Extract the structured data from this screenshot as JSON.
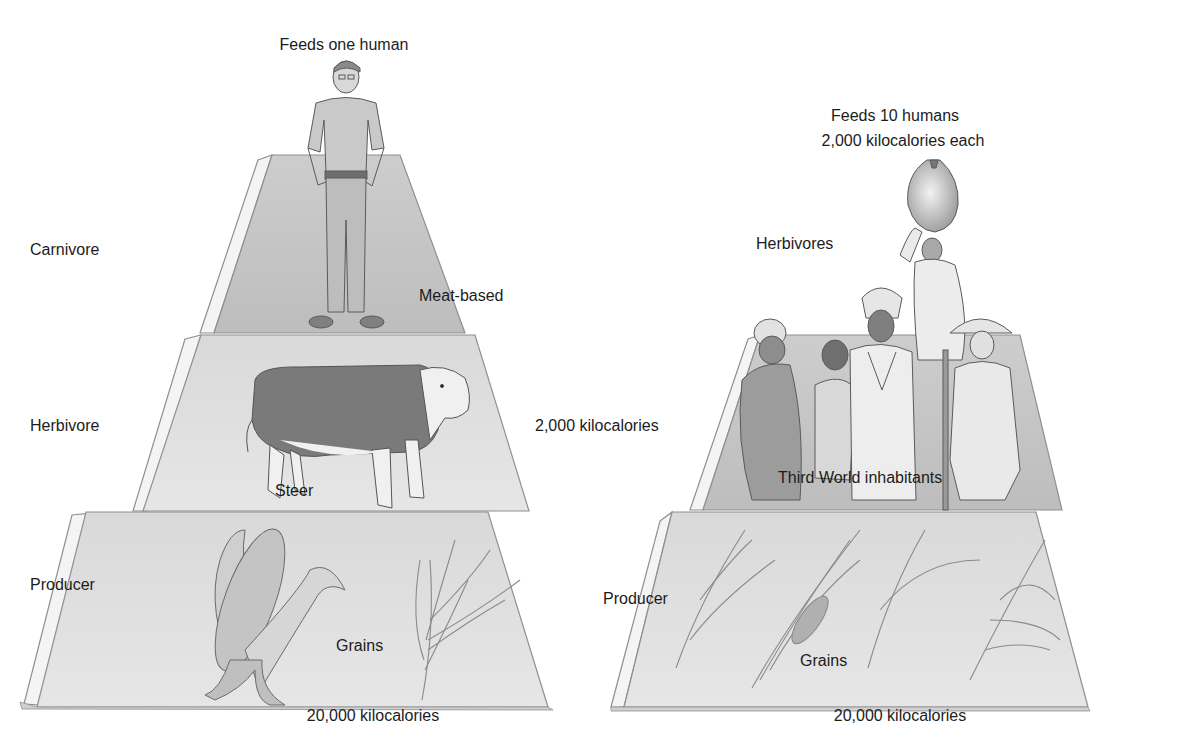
{
  "figure": {
    "colors": {
      "background": "#ffffff",
      "tier_face": "#e3e3e3",
      "tier_face_dark": "#cfcfcf",
      "tier_side": "#f4f4f4",
      "tier_edge": "#8f8f8f",
      "text": "#1c1c1c"
    }
  },
  "left_pyramid": {
    "top_label": "Feeds one human",
    "tier_labels": {
      "carnivore": "Carnivore",
      "herbivore": "Herbivore",
      "producer": "Producer"
    },
    "annotations": {
      "meat_based": "Meat-based",
      "steer": "Steer",
      "grains": "Grains"
    },
    "middle_energy": "2,000 kilocalories",
    "bottom_energy": "20,000 kilocalories",
    "illustrations": [
      "man",
      "steer",
      "corn",
      "grain-stalk"
    ]
  },
  "right_pyramid": {
    "top_label_line1": "Feeds 10 humans",
    "top_label_line2": "2,000 kilocalories each",
    "tier_labels": {
      "herbivores": "Herbivores",
      "producer": "Producer"
    },
    "annotations": {
      "inhabitants": "Third World inhabitants",
      "grains": "Grains"
    },
    "bottom_energy": "20,000 kilocalories",
    "illustrations": [
      "woman-with-gourd",
      "woman-in-headwrap",
      "child",
      "man-in-headwrap",
      "man-with-hat-and-staff",
      "grain-sprig-1",
      "grain-sprig-2",
      "grain-sprig-3",
      "grain-sprig-4"
    ]
  }
}
